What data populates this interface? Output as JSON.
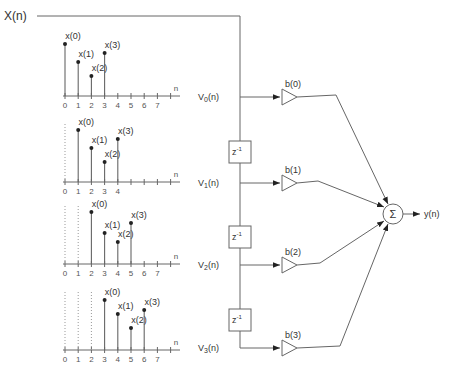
{
  "input": {
    "label": "X(n)"
  },
  "output": {
    "label": "y(n)"
  },
  "summer": {
    "symbol": "Σ"
  },
  "delay": {
    "label": "z",
    "exp": "-1"
  },
  "plots": [
    {
      "shift": 0,
      "n_label": "n",
      "ticks": [
        "0",
        "1",
        "2",
        "3",
        "4",
        "5",
        "6",
        "7"
      ],
      "samples": [
        {
          "label": "x(0)",
          "n": 0,
          "h": 52
        },
        {
          "label": "x(1)",
          "n": 1,
          "h": 34
        },
        {
          "label": "x(2)",
          "n": 2,
          "h": 20
        },
        {
          "label": "x(3)",
          "n": 3,
          "h": 43
        }
      ]
    },
    {
      "shift": 1,
      "n_label": "n",
      "ticks": [
        "0",
        "1",
        "2",
        "3",
        "4"
      ],
      "samples": [
        {
          "label": "x(0)",
          "n": 1,
          "h": 52
        },
        {
          "label": "x(1)",
          "n": 2,
          "h": 34
        },
        {
          "label": "x(2)",
          "n": 3,
          "h": 20
        },
        {
          "label": "x(3)",
          "n": 4,
          "h": 43
        }
      ]
    },
    {
      "shift": 2,
      "n_label": "n",
      "ticks": [
        "0",
        "1",
        "2",
        "3",
        "4",
        "5",
        "6",
        "7"
      ],
      "samples": [
        {
          "label": "x(0)",
          "n": 2,
          "h": 52
        },
        {
          "label": "x(1)",
          "n": 3,
          "h": 31
        },
        {
          "label": "x(2)",
          "n": 4,
          "h": 22
        },
        {
          "label": "x(3)",
          "n": 5,
          "h": 41
        }
      ]
    },
    {
      "shift": 3,
      "n_label": "n",
      "ticks": [
        "0",
        "1",
        "2",
        "3",
        "4",
        "5",
        "6",
        "7"
      ],
      "samples": [
        {
          "label": "x(0)",
          "n": 3,
          "h": 50
        },
        {
          "label": "x(1)",
          "n": 4,
          "h": 36
        },
        {
          "label": "x(2)",
          "n": 5,
          "h": 22
        },
        {
          "label": "x(3)",
          "n": 6,
          "h": 40
        }
      ]
    }
  ],
  "taps": [
    {
      "v_label": "V",
      "v_sub": "0",
      "v_suffix": "(n)",
      "gain": "b(0)"
    },
    {
      "v_label": "V",
      "v_sub": "1",
      "v_suffix": "(n)",
      "gain": "b(1)"
    },
    {
      "v_label": "V",
      "v_sub": "2",
      "v_suffix": "(n)",
      "gain": "b(2)"
    },
    {
      "v_label": "V",
      "v_sub": "3",
      "v_suffix": "(n)",
      "gain": "b(3)"
    }
  ]
}
